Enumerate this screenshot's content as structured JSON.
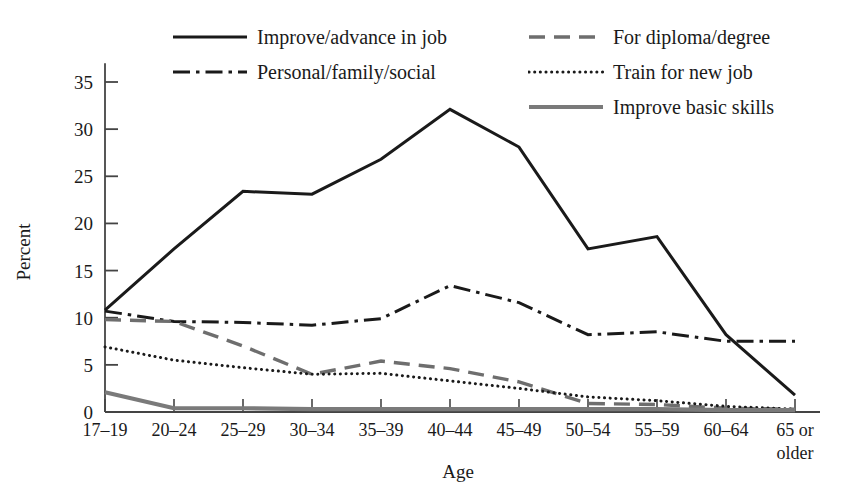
{
  "chart_data": {
    "type": "line",
    "title": "",
    "xlabel": "Age",
    "ylabel": "Percent",
    "categories": [
      "17–19",
      "20–24",
      "25–29",
      "30–34",
      "35–39",
      "40–44",
      "45–49",
      "50–54",
      "55–59",
      "60–64",
      "65 or older"
    ],
    "category_lines": [
      [
        "17–19"
      ],
      [
        "20–24"
      ],
      [
        "25–29"
      ],
      [
        "30–34"
      ],
      [
        "35–39"
      ],
      [
        "40–44"
      ],
      [
        "45–49"
      ],
      [
        "50–54"
      ],
      [
        "55–59"
      ],
      [
        "60–64"
      ],
      [
        "65 or",
        "older"
      ]
    ],
    "ylim": [
      0,
      37
    ],
    "yticks": [
      0,
      5,
      10,
      15,
      20,
      25,
      30,
      35
    ],
    "ytick_labels": [
      "0",
      "5",
      "10",
      "15",
      "20",
      "25",
      "30",
      "35"
    ],
    "grid": false,
    "legend_position": "top",
    "series": [
      {
        "name": "Improve/advance in job",
        "style": "solid",
        "color": "#1a1a1a",
        "width": 3.0,
        "values": [
          10.8,
          17.3,
          23.4,
          23.1,
          26.8,
          32.1,
          28.1,
          17.3,
          18.6,
          8.2,
          1.8
        ]
      },
      {
        "name": "Personal/family/social",
        "style": "dashdot",
        "color": "#1a1a1a",
        "width": 3.0,
        "values": [
          10.7,
          9.6,
          9.5,
          9.2,
          9.9,
          13.4,
          11.6,
          8.2,
          8.5,
          7.5,
          7.5
        ]
      },
      {
        "name": "For diploma/degree",
        "style": "dashed",
        "color": "#6e6e6e",
        "width": 3.4,
        "values": [
          9.8,
          9.6,
          7.0,
          4.0,
          5.4,
          4.6,
          3.2,
          0.9,
          0.8,
          0.4,
          0.3
        ]
      },
      {
        "name": "Train for new job",
        "style": "dotted",
        "color": "#1a1a1a",
        "width": 3.0,
        "values": [
          6.9,
          5.5,
          4.7,
          4.0,
          4.1,
          3.3,
          2.5,
          1.6,
          1.2,
          0.6,
          0.3
        ]
      },
      {
        "name": "Improve basic skills",
        "style": "solid",
        "color": "#7a7a7a",
        "width": 4.2,
        "values": [
          2.1,
          0.4,
          0.4,
          0.3,
          0.3,
          0.3,
          0.3,
          0.3,
          0.3,
          0.2,
          0.2
        ]
      }
    ]
  },
  "legend": {
    "columns": [
      {
        "items": [
          "Improve/advance in job",
          "Personal/family/social"
        ]
      },
      {
        "items": [
          "For diploma/degree",
          "Train for new job",
          "Improve basic skills"
        ]
      }
    ]
  },
  "axes": {
    "y_title": "Percent",
    "x_title": "Age"
  },
  "colors": {
    "background": "#ffffff",
    "ink": "#1a1a1a",
    "gray_dash": "#6e6e6e",
    "gray_solid": "#7a7a7a",
    "axis": "#444444"
  }
}
